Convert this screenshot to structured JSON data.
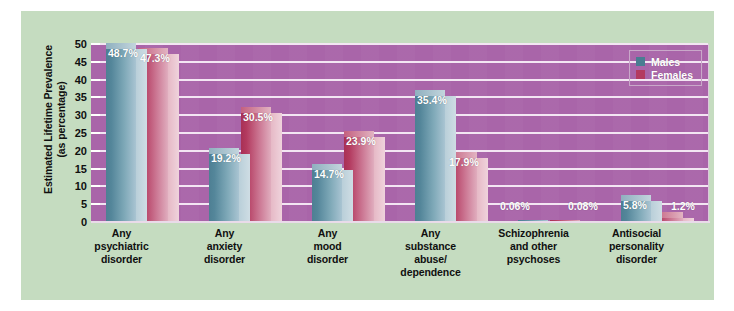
{
  "chart_data": {
    "type": "bar",
    "title": "",
    "xlabel": "",
    "ylabel": "Estimated Lifetime Prevalence (as percentage)",
    "ylabel_line1": "Estimated Lifetime Prevalence",
    "ylabel_line2": "(as percentage)",
    "ylim": [
      0,
      50
    ],
    "grid": true,
    "legend_position": "top-right",
    "yticks": [
      50,
      45,
      40,
      35,
      30,
      25,
      20,
      15,
      10,
      5,
      0
    ],
    "categories": [
      "Any psychiatric disorder",
      "Any anxiety disorder",
      "Any mood disorder",
      "Any substance abuse/ dependence",
      "Schizophrenia and other psychoses",
      "Antisocial personality disorder"
    ],
    "category_lines": [
      [
        "Any",
        "psychiatric",
        "disorder"
      ],
      [
        "Any",
        "anxiety",
        "disorder"
      ],
      [
        "Any",
        "mood",
        "disorder"
      ],
      [
        "Any",
        "substance",
        "abuse/",
        "dependence"
      ],
      [
        "Schizophrenia",
        "and other",
        "psychoses"
      ],
      [
        "Antisocial",
        "personality",
        "disorder"
      ]
    ],
    "series": [
      {
        "name": "Males",
        "color": "#4a7d92",
        "values": [
          48.7,
          19.2,
          14.7,
          35.4,
          0.06,
          5.8
        ],
        "labels": [
          "48.7%",
          "19.2%",
          "14.7%",
          "35.4%",
          "0.06%",
          "5.8%"
        ]
      },
      {
        "name": "Females",
        "color": "#b33a5f",
        "values": [
          47.3,
          30.5,
          23.9,
          17.9,
          0.08,
          1.2
        ],
        "labels": [
          "47.3%",
          "30.5%",
          "23.9%",
          "17.9%",
          "0.08%",
          "1.2%"
        ]
      }
    ]
  },
  "legend": {
    "items": [
      {
        "label": "Males"
      },
      {
        "label": "Females"
      }
    ]
  },
  "colors": {
    "card_background": "#c5dcc0",
    "plot_background": "#a965a9",
    "gridline": "#f3e6f3",
    "male": "#4a7d92",
    "female": "#b33a5f",
    "text": "#101010",
    "value_label": "#ffffff"
  }
}
